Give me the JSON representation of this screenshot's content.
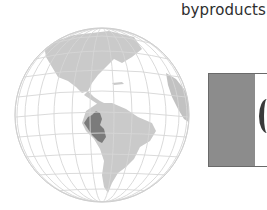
{
  "text": {
    "caption": "byproducts."
  },
  "figures": {
    "globe": {
      "subject": "globe-map",
      "highlighted_country": "Peru",
      "colors": {
        "ocean": "#ffffff",
        "land": "#c9c9c9",
        "highlight": "#7b7b7b",
        "grid": "#d6d6d6"
      }
    },
    "flag": {
      "subject": "flag-of-peru-partial",
      "colors": {
        "band": "#8c8c8c",
        "white": "#ffffff",
        "emblem": "#3a3a3a"
      }
    }
  }
}
